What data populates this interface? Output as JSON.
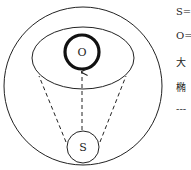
{
  "diagram": {
    "labels": {
      "outer_center": "O",
      "observer": "S"
    },
    "colors": {
      "stroke": "#222222",
      "background": "#ffffff"
    }
  },
  "legend": {
    "items": [
      {
        "text": "S="
      },
      {
        "text": "O="
      },
      {
        "text": "大"
      },
      {
        "text": "椭"
      },
      {
        "text": "---"
      }
    ]
  }
}
